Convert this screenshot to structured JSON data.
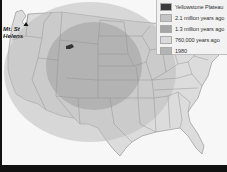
{
  "map": {
    "labels": {
      "mt_st_helens": "Mt. St. Helens",
      "mt_st_helens_line1": "Mt. St",
      "mt_st_helens_line2": "Helens"
    },
    "colors": {
      "background": "#f7f7f7",
      "land": "#dcdcdc",
      "state_border": "#9a9a9a",
      "ash_2_1_million": "#c2c2c2",
      "ash_1_3_million": "#a9a9a9",
      "ash_760000": "#d5d5d5",
      "ash_1980": "#b5b5b5",
      "yellowstone": "#3a3a3a",
      "frame": "#111111"
    }
  },
  "legend": {
    "items": [
      {
        "label": "Yellowstone Plateau",
        "color": "#3c3c3c"
      },
      {
        "label": "2.1 million years ago",
        "color": "#c4c4c4"
      },
      {
        "label": "1.3 million years ago",
        "color": "#a6a6a6"
      },
      {
        "label": "760,000 years ago",
        "color": "#dadada"
      },
      {
        "label": "1980",
        "color": "#b3b3b3"
      }
    ]
  }
}
